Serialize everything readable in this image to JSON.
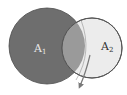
{
  "diagram": {
    "type": "overlapping-circles",
    "sets": [
      {
        "id": "A1",
        "label": "A",
        "subscript": "1",
        "fill": "#6e6e6e",
        "label_color": "#e8e8e8"
      },
      {
        "id": "A2",
        "label": "A",
        "subscript": "2",
        "fill": "#ececec",
        "label_color": "#333333"
      }
    ],
    "overlap_fill": "#9a9a9a",
    "arrow": {
      "direction": "down-left",
      "color": "#7a7a7a"
    }
  }
}
